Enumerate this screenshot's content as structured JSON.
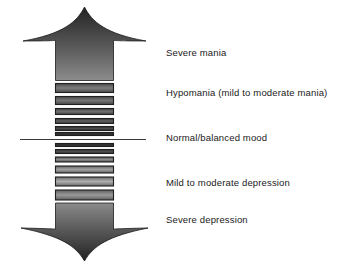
{
  "figure": {
    "background_color": "#ffffff"
  },
  "labels": [
    {
      "id": "severe-mania",
      "text": "Severe mania"
    },
    {
      "id": "hypomania",
      "text": "Hypomania (mild to moderate mania)"
    },
    {
      "id": "normal",
      "text": "Normal/balanced mood"
    },
    {
      "id": "mild-moderate-dep",
      "text": "Mild to moderate depression"
    },
    {
      "id": "severe-depression",
      "text": "Severe depression"
    }
  ],
  "graphic": {
    "up_arrow": {
      "name": "up-arrow-severe-mania",
      "fill_dark": "#2b2b2b",
      "fill_light": "#8c8c8c"
    },
    "down_arrow": {
      "name": "down-arrow-severe-depression",
      "fill_dark": "#2a2a2a",
      "fill_light": "#8a8a8a"
    },
    "baseline": {
      "name": "normal-mood-baseline",
      "color": "#3a3a3a",
      "x1": 20,
      "x2": 146,
      "y": 137
    },
    "bars_above": [
      {
        "height": 9,
        "fill_light": "#7d7d7d",
        "fill_dark": "#4a4a4a"
      },
      {
        "height": 8,
        "fill_light": "#767676",
        "fill_dark": "#474747"
      },
      {
        "height": 6,
        "fill_light": "#6e6e6e",
        "fill_dark": "#424242"
      },
      {
        "height": 5,
        "fill_light": "#5e5e5e",
        "fill_dark": "#383838"
      },
      {
        "height": 4,
        "fill_light": "#4a4a4a",
        "fill_dark": "#2c2c2c"
      },
      {
        "height": 3,
        "fill_light": "#3a3a3a",
        "fill_dark": "#222222"
      }
    ],
    "bars_below": [
      {
        "height": 3,
        "fill_light": "#3a3a3a",
        "fill_dark": "#222222"
      },
      {
        "height": 4,
        "fill_light": "#4e4e4e",
        "fill_dark": "#2f2f2f"
      },
      {
        "height": 5,
        "fill_light": "#8a8a8a",
        "fill_dark": "#555555"
      },
      {
        "height": 7,
        "fill_light": "#a2a2a2",
        "fill_dark": "#626262"
      },
      {
        "height": 9,
        "fill_light": "#aeaeae",
        "fill_dark": "#6a6a6a"
      },
      {
        "height": 10,
        "fill_light": "#9a9a9a",
        "fill_dark": "#5e5e5e"
      }
    ]
  }
}
